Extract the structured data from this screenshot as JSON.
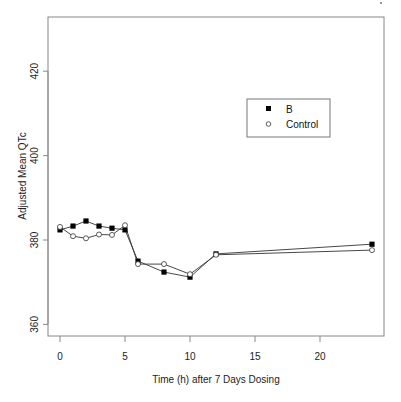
{
  "chart_data": {
    "type": "line",
    "title": "",
    "xlabel": "Time (h) after 7 Days Dosing",
    "ylabel": "Adjusted Mean QTc",
    "xlim": [
      -1,
      25
    ],
    "ylim": [
      356,
      432
    ],
    "xticks": [
      0,
      5,
      10,
      15,
      20
    ],
    "yticks": [
      360,
      380,
      400,
      420
    ],
    "grid": false,
    "legend_position": "upper right (inside)",
    "x": [
      0,
      1,
      2,
      3,
      4,
      5,
      6,
      8,
      10,
      12,
      24
    ],
    "series": [
      {
        "name": "B",
        "marker": "filled-square",
        "values": [
          382.4,
          383.3,
          384.5,
          383.3,
          382.8,
          382.4,
          375.0,
          372.4,
          371.2,
          376.7,
          379.0
        ]
      },
      {
        "name": "Control",
        "marker": "open-circle",
        "values": [
          383.1,
          380.9,
          380.4,
          381.3,
          381.2,
          383.5,
          374.3,
          374.3,
          371.9,
          376.5,
          377.6
        ]
      }
    ]
  },
  "legend": {
    "items": [
      {
        "label": "B"
      },
      {
        "label": "Control"
      }
    ]
  },
  "axes": {
    "xlabel": "Time (h) after 7 Days Dosing",
    "ylabel": "Adjusted Mean QTc",
    "xtick_labels": [
      "0",
      "5",
      "10",
      "15",
      "20"
    ],
    "ytick_labels": [
      "360",
      "380",
      "400",
      "420"
    ]
  }
}
